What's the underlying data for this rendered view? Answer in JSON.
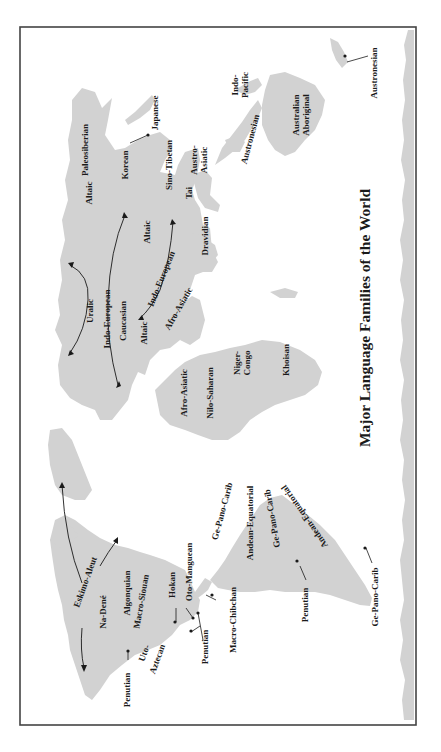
{
  "title": "Major Language Families of the World",
  "orientation": "rotated 90 degrees counter-clockwise",
  "colors": {
    "land": "#d2d2d2",
    "frame": "#444444",
    "text": "#1a1a1a",
    "background": "#ffffff"
  },
  "labels": {
    "paleosiberian": "Paleosiberian",
    "japanese": "Japanese",
    "korean": "Korean",
    "indo_pacific": "Indo-\nPacific",
    "indo_pacific_l1": "Indo-",
    "indo_pacific_l2": "Pacific",
    "austronesian_nz": "Austronesian",
    "australian_aboriginal_l1": "Australian",
    "australian_aboriginal_l2": "Aboriginal",
    "austronesian_sea": "Austronesian",
    "austro_asiatic_l1": "Austro-",
    "austro_asiatic_l2": "Asiatic",
    "sino_tibetan": "Sino-Tibetan",
    "tai": "Tai",
    "altaic_north": "Altaic",
    "altaic_central": "Altaic",
    "dravidian": "Dravidian",
    "uralic": "Uralic",
    "indo_european_west": "Indo-European",
    "indo_european_east": "Indo-European",
    "caucasian": "Caucasian",
    "altaic_turkey": "Altaic",
    "afro_asiatic_mideast": "Afro-Asiatic",
    "afro_asiatic_africa": "Afro-Asiatic",
    "nilo_saharan": "Nilo-Saharan",
    "niger_congo_l1": "Niger-",
    "niger_congo_l2": "Congo",
    "khoisan": "Khoisan",
    "eskimo_aleut": "Eskimo-Aleut",
    "na_dene": "Na-Dené",
    "algonquian": "Algonquian",
    "macro_siouan": "Macro-Siouan",
    "hokan": "Hokan",
    "oto_manguean": "Oto-Manguean",
    "penutian_na": "Penutian",
    "uto_aztecan_l1": "Uto-",
    "uto_aztecan_l2": "Aztecan",
    "penutian_ca": "Penutian",
    "macro_chibchan": "Macro-Chibchan",
    "ge_pano_carib_north": "Ge-Pano-Carib",
    "andean_equatorial_1": "Andean-Equatorial",
    "ge_pano_carib_east": "Ge-Pano-Carib",
    "andean_equatorial_2": "Andean-Equatorial",
    "penutian_sa": "Penutian",
    "ge_pano_carib_south": "Ge-Pano-Carib"
  }
}
